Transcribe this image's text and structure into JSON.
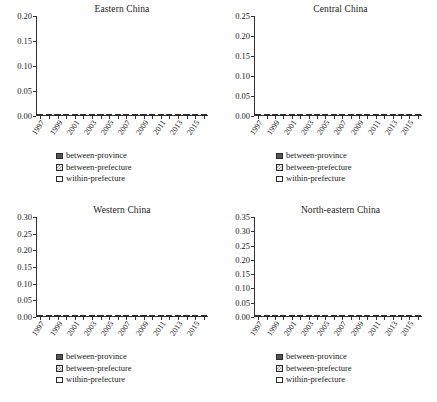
{
  "figure": {
    "background": "#ffffff",
    "series_colors": {
      "between-province": "#56565a",
      "between-prefecture": "#8d8d8d",
      "within-prefecture": "#ffffff"
    },
    "legend_labels": [
      "between-province",
      "between-prefecture",
      "within-prefecture"
    ]
  },
  "chart_data": [
    {
      "type": "bar",
      "title": "Eastern China",
      "stacked": true,
      "xlabel": "",
      "ylabel": "",
      "ylim": [
        0,
        0.2
      ],
      "yticks": [
        "0.00",
        "0.05",
        "0.10",
        "0.15",
        "0.20"
      ],
      "ytick_values": [
        0,
        0.05,
        0.1,
        0.15,
        0.2
      ],
      "grid": false,
      "legend_position": "below",
      "categories": [
        1997,
        1998,
        1999,
        2000,
        2001,
        2002,
        2003,
        2004,
        2005,
        2006,
        2007,
        2008,
        2009,
        2010,
        2011,
        2012,
        2013,
        2014,
        2015,
        2016
      ],
      "tick_labels": [
        "1997",
        "",
        "1999",
        "",
        "2001",
        "",
        "2003",
        "",
        "2005",
        "",
        "2007",
        "",
        "2009",
        "",
        "2011",
        "",
        "2013",
        "",
        "2015",
        ""
      ],
      "series": [
        {
          "name": "between-province",
          "values": [
            0.056,
            0.049,
            0.05,
            0.049,
            0.049,
            0.046,
            0.044,
            0.043,
            0.044,
            0.038,
            0.038,
            0.037,
            0.034,
            0.033,
            0.031,
            0.031,
            0.03,
            0.03,
            0.029,
            0.029
          ]
        },
        {
          "name": "between-prefecture",
          "values": [
            0.087,
            0.088,
            0.089,
            0.09,
            0.089,
            0.093,
            0.096,
            0.098,
            0.101,
            0.107,
            0.102,
            0.094,
            0.091,
            0.086,
            0.084,
            0.081,
            0.078,
            0.074,
            0.07,
            0.067
          ]
        },
        {
          "name": "within-prefecture",
          "values": [
            0.035,
            0.034,
            0.031,
            0.032,
            0.03,
            0.03,
            0.027,
            0.023,
            0.032,
            0.026,
            0.031,
            0.03,
            0.026,
            0.022,
            0.024,
            0.018,
            0.018,
            0.016,
            0.021,
            0.021
          ]
        }
      ],
      "totals": [
        0.178,
        0.171,
        0.17,
        0.171,
        0.168,
        0.169,
        0.167,
        0.164,
        0.177,
        0.171,
        0.171,
        0.161,
        0.151,
        0.141,
        0.139,
        0.13,
        0.126,
        0.12,
        0.12,
        0.117
      ]
    },
    {
      "type": "bar",
      "title": "Central China",
      "stacked": true,
      "xlabel": "",
      "ylabel": "",
      "ylim": [
        0,
        0.25
      ],
      "yticks": [
        "0.00",
        "0.05",
        "0.10",
        "0.15",
        "0.20",
        "0.25"
      ],
      "ytick_values": [
        0,
        0.05,
        0.1,
        0.15,
        0.2,
        0.25
      ],
      "grid": false,
      "legend_position": "below",
      "categories": [
        1997,
        1998,
        1999,
        2000,
        2001,
        2002,
        2003,
        2004,
        2005,
        2006,
        2007,
        2008,
        2009,
        2010,
        2011,
        2012,
        2013,
        2014,
        2015,
        2016
      ],
      "tick_labels": [
        "1997",
        "",
        "1999",
        "",
        "2001",
        "",
        "2003",
        "",
        "2005",
        "",
        "2007",
        "",
        "2009",
        "",
        "2011",
        "",
        "2013",
        "",
        "2015",
        ""
      ],
      "series": [
        {
          "name": "between-province",
          "values": [
            0.013,
            0.014,
            0.007,
            0.008,
            0.012,
            0.009,
            0.009,
            0.005,
            0.004,
            0.004,
            0.004,
            0.004,
            0.004,
            0.004,
            0.005,
            0.007,
            0.007,
            0.008,
            0.008,
            0.009
          ]
        },
        {
          "name": "between-prefecture",
          "values": [
            0.067,
            0.064,
            0.068,
            0.074,
            0.075,
            0.081,
            0.08,
            0.086,
            0.097,
            0.098,
            0.105,
            0.108,
            0.114,
            0.115,
            0.117,
            0.116,
            0.109,
            0.108,
            0.11,
            0.108
          ]
        },
        {
          "name": "within-prefecture",
          "values": [
            0.089,
            0.119,
            0.093,
            0.094,
            0.099,
            0.097,
            0.101,
            0.096,
            0.089,
            0.084,
            0.081,
            0.078,
            0.072,
            0.071,
            0.067,
            0.066,
            0.058,
            0.057,
            0.052,
            0.049
          ]
        }
      ],
      "totals": [
        0.169,
        0.197,
        0.168,
        0.176,
        0.186,
        0.187,
        0.19,
        0.187,
        0.19,
        0.186,
        0.19,
        0.19,
        0.19,
        0.19,
        0.189,
        0.189,
        0.174,
        0.173,
        0.17,
        0.166
      ]
    },
    {
      "type": "bar",
      "title": "Western China",
      "stacked": true,
      "xlabel": "",
      "ylabel": "",
      "ylim": [
        0,
        0.3
      ],
      "yticks": [
        "0.00",
        "0.05",
        "0.10",
        "0.15",
        "0.20",
        "0.25",
        "0.30"
      ],
      "ytick_values": [
        0,
        0.05,
        0.1,
        0.15,
        0.2,
        0.25,
        0.3
      ],
      "grid": false,
      "legend_position": "below",
      "categories": [
        1997,
        1998,
        1999,
        2000,
        2001,
        2002,
        2003,
        2004,
        2005,
        2006,
        2007,
        2008,
        2009,
        2010,
        2011,
        2012,
        2013,
        2014,
        2015,
        2016
      ],
      "tick_labels": [
        "1997",
        "",
        "1999",
        "",
        "2001",
        "",
        "2003",
        "",
        "2005",
        "",
        "2007",
        "",
        "2009",
        "",
        "2011",
        "",
        "2013",
        "",
        "2015",
        ""
      ],
      "series": [
        {
          "name": "between-province",
          "values": [
            0.015,
            0.012,
            0.012,
            0.012,
            0.012,
            0.013,
            0.017,
            0.02,
            0.025,
            0.03,
            0.033,
            0.038,
            0.041,
            0.048,
            0.05,
            0.05,
            0.05,
            0.049,
            0.049,
            0.052
          ]
        },
        {
          "name": "between-prefecture",
          "values": [
            0.132,
            0.121,
            0.121,
            0.122,
            0.125,
            0.124,
            0.126,
            0.125,
            0.131,
            0.127,
            0.122,
            0.117,
            0.119,
            0.116,
            0.112,
            0.108,
            0.1,
            0.092,
            0.084,
            0.082
          ]
        },
        {
          "name": "within-prefecture",
          "values": [
            0.097,
            0.094,
            0.09,
            0.088,
            0.086,
            0.081,
            0.081,
            0.079,
            0.091,
            0.08,
            0.082,
            0.081,
            0.077,
            0.072,
            0.069,
            0.068,
            0.062,
            0.06,
            0.059,
            0.054
          ]
        }
      ],
      "totals": [
        0.244,
        0.227,
        0.223,
        0.222,
        0.223,
        0.218,
        0.224,
        0.224,
        0.247,
        0.237,
        0.237,
        0.236,
        0.237,
        0.236,
        0.231,
        0.226,
        0.212,
        0.201,
        0.192,
        0.188
      ]
    },
    {
      "type": "bar",
      "title": "North-eastern China",
      "stacked": true,
      "xlabel": "",
      "ylabel": "",
      "ylim": [
        0,
        0.35
      ],
      "yticks": [
        "0.00",
        "0.05",
        "0.10",
        "0.15",
        "0.20",
        "0.25",
        "0.30",
        "0.35"
      ],
      "ytick_values": [
        0,
        0.05,
        0.1,
        0.15,
        0.2,
        0.25,
        0.3,
        0.35
      ],
      "grid": false,
      "legend_position": "below",
      "categories": [
        1997,
        1998,
        1999,
        2000,
        2001,
        2002,
        2003,
        2004,
        2005,
        2006,
        2007,
        2008,
        2009,
        2010,
        2011,
        2012,
        2013,
        2014,
        2015,
        2016
      ],
      "tick_labels": [
        "1997",
        "",
        "1999",
        "",
        "2001",
        "",
        "2003",
        "",
        "2005",
        "",
        "2007",
        "",
        "2009",
        "",
        "2011",
        "",
        "2013",
        "",
        "2015",
        ""
      ],
      "series": [
        {
          "name": "between-province",
          "values": [
            0.015,
            0.013,
            0.011,
            0.012,
            0.012,
            0.013,
            0.013,
            0.021,
            0.017,
            0.022,
            0.023,
            0.018,
            0.017,
            0.016,
            0.016,
            0.008,
            0.007,
            0.007,
            0.006,
            0.006
          ]
        },
        {
          "name": "between-prefecture",
          "values": [
            0.11,
            0.11,
            0.13,
            0.173,
            0.165,
            0.151,
            0.152,
            0.14,
            0.141,
            0.134,
            0.128,
            0.123,
            0.11,
            0.111,
            0.113,
            0.112,
            0.11,
            0.104,
            0.09,
            0.086
          ]
        },
        {
          "name": "within-prefecture",
          "values": [
            0.085,
            0.083,
            0.08,
            0.119,
            0.114,
            0.104,
            0.111,
            0.098,
            0.091,
            0.101,
            0.082,
            0.091,
            0.074,
            0.072,
            0.066,
            0.059,
            0.05,
            0.049,
            0.04,
            0.043
          ]
        }
      ],
      "totals": [
        0.21,
        0.206,
        0.221,
        0.304,
        0.291,
        0.268,
        0.276,
        0.259,
        0.249,
        0.257,
        0.233,
        0.232,
        0.201,
        0.199,
        0.195,
        0.179,
        0.167,
        0.16,
        0.136,
        0.135
      ]
    }
  ]
}
